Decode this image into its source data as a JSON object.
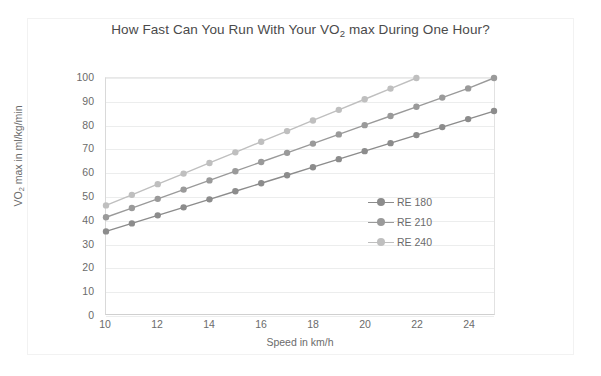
{
  "chart_data": {
    "type": "line",
    "title": "How Fast Can You Run With Your VO2 max During One Hour?",
    "title_main": "How Fast Can You Run With Your VO",
    "title_sub": "2",
    "title_tail": " max During One Hour?",
    "xlabel": "Speed in km/h",
    "ylabel": "VO2 max in ml/kg/min",
    "ylabel_main": "VO",
    "ylabel_sub": "2",
    "ylabel_tail": " max in ml/kg/min",
    "xlim": [
      10,
      25
    ],
    "ylim": [
      0,
      100
    ],
    "xticks": [
      10,
      12,
      14,
      16,
      18,
      20,
      22,
      24
    ],
    "yticks": [
      0,
      10,
      20,
      30,
      40,
      50,
      60,
      70,
      80,
      90,
      100
    ],
    "grid": "horizontal",
    "legend_position": "middle-right-inside",
    "series": [
      {
        "name": "RE 180",
        "color": "#8c8c8c",
        "x": [
          10,
          11,
          12,
          13,
          14,
          15,
          16,
          17,
          18,
          19,
          20,
          21,
          22,
          23,
          24,
          25
        ],
        "values": [
          35,
          38.4,
          41.8,
          45.2,
          48.6,
          52,
          55.4,
          58.8,
          62.2,
          65.6,
          69,
          72.4,
          75.8,
          79.2,
          82.6,
          86
        ]
      },
      {
        "name": "RE 210",
        "color": "#9a9a9a",
        "x": [
          10,
          11,
          12,
          13,
          14,
          15,
          16,
          17,
          18,
          19,
          20,
          21,
          22,
          23,
          24,
          25
        ],
        "values": [
          41,
          44.9,
          48.8,
          52.7,
          56.6,
          60.5,
          64.4,
          68.3,
          72.2,
          76.1,
          80,
          83.9,
          87.8,
          91.7,
          95.6,
          100
        ]
      },
      {
        "name": "RE 240",
        "color": "#bfbfbf",
        "x": [
          10,
          11,
          12,
          13,
          14,
          15,
          16,
          17,
          18,
          19,
          20,
          21,
          22
        ],
        "values": [
          46,
          50.5,
          55,
          59.5,
          64,
          68.5,
          73,
          77.5,
          82,
          86.5,
          91,
          95.5,
          100
        ]
      }
    ]
  },
  "legend": {
    "items": [
      {
        "label": "RE 180"
      },
      {
        "label": "RE 210"
      },
      {
        "label": "RE 240"
      }
    ]
  }
}
